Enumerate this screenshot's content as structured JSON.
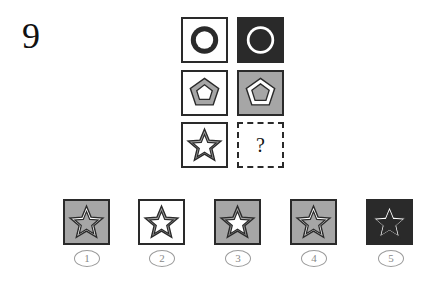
{
  "question": {
    "number": "9",
    "missing_mark": "?"
  },
  "colors": {
    "black": "#2a2a2a",
    "gray": "#a6a6a6",
    "white": "#ffffff"
  },
  "grid": [
    {
      "row": 1,
      "col": 1,
      "shape": "circle",
      "background": "white",
      "outer": "black",
      "inner_band": "black",
      "center": "white"
    },
    {
      "row": 1,
      "col": 2,
      "shape": "circle",
      "background": "black",
      "outer": "white",
      "inner_band": "white",
      "center": "black"
    },
    {
      "row": 2,
      "col": 1,
      "shape": "pentagon",
      "background": "white",
      "outer": "black",
      "inner_band": "gray",
      "center": "white"
    },
    {
      "row": 2,
      "col": 2,
      "shape": "pentagon",
      "background": "gray",
      "outer": "black",
      "inner_band": "white",
      "center": "gray"
    },
    {
      "row": 3,
      "col": 1,
      "shape": "star",
      "background": "white",
      "outer": "black",
      "inner_band": "gray",
      "center": "white"
    },
    {
      "row": 3,
      "col": 2,
      "shape": "unknown"
    }
  ],
  "options": [
    {
      "label": "1",
      "shape": "star",
      "background": "gray",
      "band": "white",
      "center": "gray"
    },
    {
      "label": "2",
      "shape": "star",
      "background": "white",
      "band": "gray",
      "center": "white"
    },
    {
      "label": "3",
      "shape": "star",
      "background": "gray",
      "band": "gray",
      "center": "white"
    },
    {
      "label": "4",
      "shape": "star",
      "background": "gray",
      "band": "white",
      "center": "gray"
    },
    {
      "label": "5",
      "shape": "star",
      "background": "black",
      "band": "white",
      "center": "black"
    }
  ]
}
